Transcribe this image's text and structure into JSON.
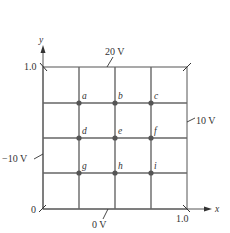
{
  "diagram": {
    "type": "grid potential boundary diagram",
    "axes": {
      "x_label": "x",
      "y_label": "y",
      "x_max_label": "1.0",
      "y_max_label": "1.0",
      "origin_label": "0"
    },
    "boundaries": {
      "top": "20 V",
      "left": "−10 V",
      "right": "10 V",
      "bottom": "0 V"
    },
    "points": [
      {
        "id": "a",
        "label": "a"
      },
      {
        "id": "b",
        "label": "b"
      },
      {
        "id": "c",
        "label": "c"
      },
      {
        "id": "d",
        "label": "d"
      },
      {
        "id": "e",
        "label": "e"
      },
      {
        "id": "f",
        "label": "f"
      },
      {
        "id": "g",
        "label": "g"
      },
      {
        "id": "h",
        "label": "h"
      },
      {
        "id": "i",
        "label": "i"
      }
    ],
    "colors": {
      "line": "#555555",
      "point": "#555555",
      "text": "#333333"
    }
  }
}
